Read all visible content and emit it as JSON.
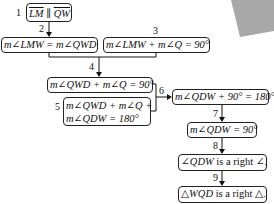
{
  "diagram": {
    "type": "flow-proof",
    "decoration_color": "#a8a8a8",
    "steps": [
      {
        "num": "1",
        "statement": "LM ∥ QW",
        "parts": [
          "LM",
          " ∥ ",
          "QW"
        ]
      },
      {
        "num": "2",
        "statement": "m∠LMW = m∠QWD"
      },
      {
        "num": "3",
        "statement": "m∠LMW + m∠Q = 90°"
      },
      {
        "num": "4",
        "statement": "m∠QWD + m∠Q = 90°"
      },
      {
        "num": "5",
        "statement_line1": "m∠QWD + m∠Q +",
        "statement_line2": "m∠QDW = 180°"
      },
      {
        "num": "6",
        "statement": "m∠QDW + 90° = 180°"
      },
      {
        "num": "7",
        "statement": "m∠QDW = 90°"
      },
      {
        "num": "8",
        "statement_italic": "∠QDW",
        "statement_rest": " is a right ∠."
      },
      {
        "num": "9",
        "statement_italic": "△WQD",
        "statement_rest": " is a right △."
      }
    ]
  }
}
